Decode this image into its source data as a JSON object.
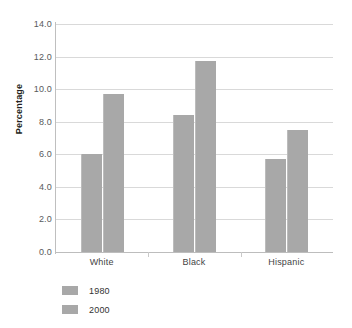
{
  "chart_data": {
    "type": "bar",
    "title": "",
    "xlabel": "",
    "ylabel": "Percentage",
    "categories": [
      "White",
      "Black",
      "Hispanic"
    ],
    "series": [
      {
        "name": "1980",
        "values": [
          6.0,
          8.4,
          5.7
        ],
        "color": "#a8a8a8"
      },
      {
        "name": "2000",
        "values": [
          9.7,
          11.7,
          7.5
        ],
        "color": "#a8a8a8"
      }
    ],
    "ylim": [
      0.0,
      14.0
    ],
    "ytick_step": 2.0,
    "yticks": [
      "0.0",
      "2.0",
      "4.0",
      "6.0",
      "8.0",
      "10.0",
      "12.0",
      "14.0"
    ],
    "ytick_values": [
      0.0,
      2.0,
      4.0,
      6.0,
      8.0,
      10.0,
      12.0,
      14.0
    ],
    "grid": true,
    "legend_position": "bottom-left"
  },
  "axis": {
    "y_title": "Percentage"
  },
  "legend": {
    "items": [
      {
        "label": "1980"
      },
      {
        "label": "2000"
      }
    ]
  }
}
